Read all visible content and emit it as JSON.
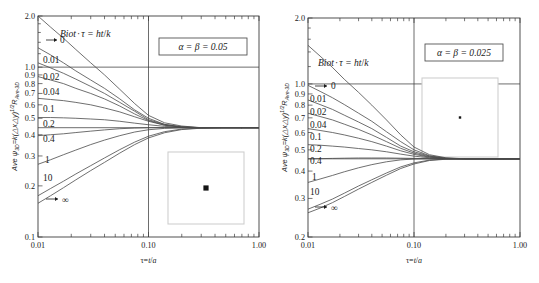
{
  "figure": {
    "panels": [
      {
        "id": "panel-left",
        "param_label": "α = β = 0.05",
        "biot_title": "Biot·τ = ht/k",
        "xlabel": "τ=t/a",
        "ylabel_prefix": "Ave ",
        "ylabel_psi": "ψ",
        "ylabel_psi_sub": "3D",
        "ylabel_mid": "=k(△x△y)",
        "ylabel_exp": "1/2",
        "ylabel_R": "R",
        "ylabel_R_sub": "Ave-3D",
        "x_ticks": [
          "0.01",
          "0.10",
          "1.00"
        ],
        "y_ticks": [
          "0.1",
          "0.2",
          "0.3",
          "0.4",
          "0.5",
          "0.6",
          "0.7",
          "0.8",
          "0.9",
          "1.0",
          "2.0"
        ],
        "curve_labels": [
          "0",
          "0.01",
          "0.02",
          "0.04",
          "0.1",
          "0.2",
          "0.4",
          "1",
          "10",
          "∞"
        ],
        "hline_values": [
          1.0,
          0.44
        ],
        "vline_value": 0.1,
        "inset": {
          "name": "square-with-center-dot",
          "dot_size": "small-square"
        }
      },
      {
        "id": "panel-right",
        "param_label": "α = β = 0.025",
        "biot_title": "Biot·τ = ht/k",
        "xlabel": "τ=t/a",
        "ylabel_prefix": "Ave ",
        "ylabel_psi": "ψ",
        "ylabel_psi_sub": "3D",
        "ylabel_mid": "=k(△x△y)",
        "ylabel_exp": "1/2",
        "ylabel_R": "R",
        "ylabel_R_sub": "Ave-3D",
        "x_ticks": [
          "0.01",
          "0.10",
          "1.00"
        ],
        "y_ticks": [
          "0.2",
          "0.3",
          "0.4",
          "0.5",
          "0.6",
          "0.7",
          "0.8",
          "0.9",
          "1.0",
          "2.0"
        ],
        "curve_labels": [
          "0",
          "0.01",
          "0.02",
          "0.04",
          "0.1",
          "0.2",
          "0.4",
          "1",
          "10",
          "∞"
        ],
        "hline_values": [
          1.0,
          0.455
        ],
        "vline_value": 0.1,
        "inset": {
          "name": "square-with-center-dot",
          "dot_size": "tiny-dot"
        }
      }
    ]
  },
  "chart_data": [
    {
      "type": "line",
      "title": "",
      "panel": "alpha=beta=0.05",
      "xlabel": "τ=t/a",
      "ylabel": "Ave ψ_3D = k(ΔxΔy)^1/2 R_Ave-3D",
      "xscale": "log",
      "yscale": "log",
      "xlim": [
        0.01,
        1.0
      ],
      "ylim": [
        0.1,
        2.0
      ],
      "xticks": [
        0.01,
        0.1,
        1.0
      ],
      "yticks": [
        0.1,
        0.2,
        0.3,
        0.4,
        0.5,
        0.6,
        0.7,
        0.8,
        0.9,
        1.0,
        2.0
      ],
      "grid": false,
      "legend": "inline curve labels at left",
      "annotations": [
        "Biot·τ = ht/k",
        "α = β = 0.05"
      ],
      "reference_lines": {
        "horizontal": [
          1.0,
          0.44
        ],
        "vertical": [
          0.1
        ]
      },
      "x": [
        0.01,
        0.013,
        0.017,
        0.022,
        0.03,
        0.04,
        0.055,
        0.075,
        0.1,
        0.14,
        0.2,
        0.3,
        0.45,
        0.7,
        1.0
      ],
      "series": [
        {
          "name": "0",
          "values": [
            2.0,
            1.72,
            1.48,
            1.27,
            1.06,
            0.9,
            0.74,
            0.61,
            0.52,
            0.47,
            0.45,
            0.44,
            0.44,
            0.44,
            0.44
          ]
        },
        {
          "name": "0.01",
          "values": [
            1.3,
            1.18,
            1.06,
            0.95,
            0.84,
            0.75,
            0.65,
            0.56,
            0.5,
            0.46,
            0.445,
            0.44,
            0.44,
            0.44,
            0.44
          ]
        },
        {
          "name": "0.02",
          "values": [
            1.06,
            0.99,
            0.92,
            0.85,
            0.77,
            0.7,
            0.62,
            0.55,
            0.49,
            0.46,
            0.445,
            0.44,
            0.44,
            0.44,
            0.44
          ]
        },
        {
          "name": "0.04",
          "values": [
            0.88,
            0.84,
            0.8,
            0.75,
            0.7,
            0.65,
            0.59,
            0.53,
            0.485,
            0.455,
            0.443,
            0.44,
            0.44,
            0.44,
            0.44
          ]
        },
        {
          "name": "0.1",
          "values": [
            0.655,
            0.645,
            0.635,
            0.62,
            0.6,
            0.575,
            0.545,
            0.51,
            0.48,
            0.455,
            0.443,
            0.44,
            0.44,
            0.44,
            0.44
          ]
        },
        {
          "name": "0.2",
          "values": [
            0.505,
            0.505,
            0.503,
            0.5,
            0.495,
            0.49,
            0.48,
            0.468,
            0.458,
            0.448,
            0.442,
            0.44,
            0.44,
            0.44,
            0.44
          ]
        },
        {
          "name": "0.4",
          "values": [
            0.395,
            0.4,
            0.405,
            0.412,
            0.42,
            0.427,
            0.434,
            0.438,
            0.44,
            0.441,
            0.441,
            0.44,
            0.44,
            0.44,
            0.44
          ]
        },
        {
          "name": "1",
          "values": [
            0.268,
            0.285,
            0.305,
            0.325,
            0.35,
            0.372,
            0.395,
            0.415,
            0.428,
            0.436,
            0.439,
            0.44,
            0.44,
            0.44,
            0.44
          ]
        },
        {
          "name": "10",
          "values": [
            0.175,
            0.193,
            0.213,
            0.235,
            0.263,
            0.292,
            0.327,
            0.362,
            0.392,
            0.417,
            0.432,
            0.438,
            0.44,
            0.44,
            0.44
          ]
        },
        {
          "name": "∞",
          "values": [
            0.158,
            0.175,
            0.195,
            0.217,
            0.246,
            0.275,
            0.312,
            0.35,
            0.383,
            0.411,
            0.429,
            0.437,
            0.44,
            0.44,
            0.44
          ]
        }
      ]
    },
    {
      "type": "line",
      "title": "",
      "panel": "alpha=beta=0.025",
      "xlabel": "τ=t/a",
      "ylabel": "Ave ψ_3D = k(ΔxΔy)^1/2 R_Ave-3D",
      "xscale": "log",
      "yscale": "log",
      "xlim": [
        0.01,
        1.0
      ],
      "ylim": [
        0.2,
        2.0
      ],
      "xticks": [
        0.01,
        0.1,
        1.0
      ],
      "yticks": [
        0.2,
        0.3,
        0.4,
        0.5,
        0.6,
        0.7,
        0.8,
        0.9,
        1.0,
        2.0
      ],
      "grid": false,
      "legend": "inline curve labels at left",
      "annotations": [
        "Biot·τ = ht/k",
        "α = β = 0.025"
      ],
      "reference_lines": {
        "horizontal": [
          1.0,
          0.455
        ],
        "vertical": [
          0.1
        ]
      },
      "x": [
        0.01,
        0.013,
        0.017,
        0.022,
        0.03,
        0.04,
        0.055,
        0.075,
        0.1,
        0.14,
        0.2,
        0.3,
        0.45,
        0.7,
        1.0
      ],
      "series": [
        {
          "name": "0",
          "values": [
            1.5,
            1.34,
            1.19,
            1.05,
            0.915,
            0.8,
            0.685,
            0.585,
            0.515,
            0.475,
            0.46,
            0.455,
            0.455,
            0.455,
            0.455
          ]
        },
        {
          "name": "0.01",
          "values": [
            0.985,
            0.925,
            0.865,
            0.805,
            0.735,
            0.675,
            0.605,
            0.545,
            0.5,
            0.47,
            0.458,
            0.455,
            0.455,
            0.455,
            0.455
          ]
        },
        {
          "name": "0.02",
          "values": [
            0.845,
            0.805,
            0.765,
            0.72,
            0.67,
            0.625,
            0.57,
            0.52,
            0.49,
            0.468,
            0.457,
            0.455,
            0.455,
            0.455,
            0.455
          ]
        },
        {
          "name": "0.04",
          "values": [
            0.735,
            0.71,
            0.685,
            0.655,
            0.62,
            0.585,
            0.545,
            0.508,
            0.483,
            0.465,
            0.456,
            0.455,
            0.455,
            0.455,
            0.455
          ]
        },
        {
          "name": "0.1",
          "values": [
            0.625,
            0.613,
            0.6,
            0.585,
            0.565,
            0.545,
            0.52,
            0.495,
            0.477,
            0.463,
            0.456,
            0.455,
            0.455,
            0.455,
            0.455
          ]
        },
        {
          "name": "0.2",
          "values": [
            0.528,
            0.525,
            0.52,
            0.515,
            0.507,
            0.5,
            0.49,
            0.478,
            0.468,
            0.46,
            0.456,
            0.455,
            0.455,
            0.455,
            0.455
          ]
        },
        {
          "name": "0.4",
          "values": [
            0.455,
            0.456,
            0.457,
            0.458,
            0.459,
            0.459,
            0.459,
            0.458,
            0.457,
            0.456,
            0.455,
            0.455,
            0.455,
            0.455,
            0.455
          ]
        },
        {
          "name": "1",
          "values": [
            0.355,
            0.368,
            0.382,
            0.397,
            0.414,
            0.428,
            0.441,
            0.45,
            0.454,
            0.455,
            0.455,
            0.455,
            0.455,
            0.455,
            0.455
          ]
        },
        {
          "name": "10",
          "values": [
            0.268,
            0.282,
            0.298,
            0.317,
            0.342,
            0.365,
            0.392,
            0.418,
            0.436,
            0.449,
            0.454,
            0.455,
            0.455,
            0.455,
            0.455
          ]
        },
        {
          "name": "∞",
          "values": [
            0.258,
            0.271,
            0.287,
            0.306,
            0.331,
            0.355,
            0.383,
            0.411,
            0.431,
            0.447,
            0.453,
            0.455,
            0.455,
            0.455,
            0.455
          ]
        }
      ]
    }
  ]
}
